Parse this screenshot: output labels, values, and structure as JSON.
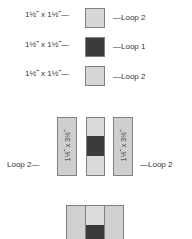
{
  "top_squares": [
    {
      "size_label": "1½˝ x 1½˝—",
      "loop_label": "—Loop 2",
      "shade": "light"
    },
    {
      "size_label": "1½˝ x 1½˝—",
      "loop_label": "—Loop 1",
      "shade": "dark"
    },
    {
      "size_label": "1½˝ x 1½˝—",
      "loop_label": "—Loop 2",
      "shade": "light"
    }
  ],
  "middle": {
    "left_strip_text": "1½˝ x 3½˝",
    "right_strip_text": "1½˝ x 3½˝",
    "left_loop_label": "Loop 2—",
    "right_loop_label": "—Loop 2"
  },
  "colors": {
    "light": "#d6d6d6",
    "dark": "#3b3b3b",
    "border": "#808080"
  }
}
